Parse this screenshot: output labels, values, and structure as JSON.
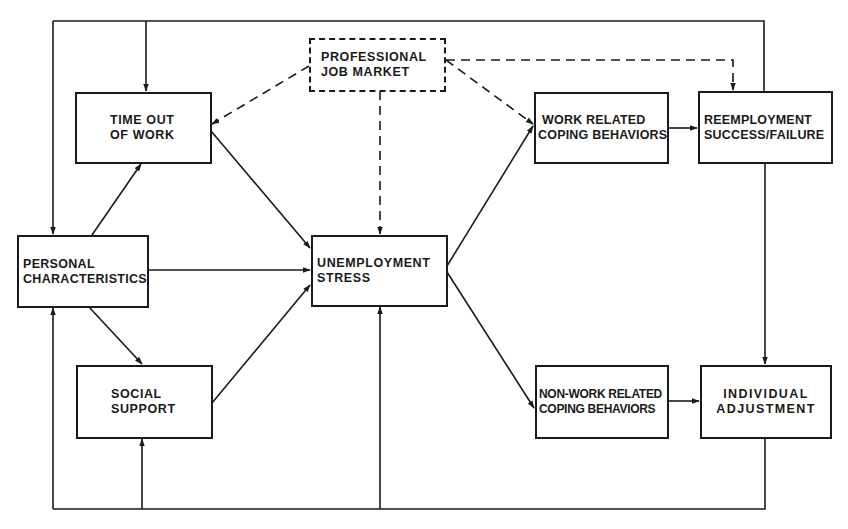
{
  "diagram": {
    "type": "flow",
    "nodes": {
      "professional_job_market": {
        "lines": [
          "PROFESSIONAL",
          "JOB MARKET"
        ],
        "style": "dashed"
      },
      "time_out_of_work": {
        "lines": [
          "TIME OUT",
          "OF WORK"
        ]
      },
      "personal_characteristics": {
        "lines": [
          "PERSONAL",
          "CHARACTERISTICS"
        ]
      },
      "social_support": {
        "lines": [
          "SOCIAL",
          "SUPPORT"
        ]
      },
      "unemployment_stress": {
        "lines": [
          "UNEMPLOYMENT",
          "STRESS"
        ]
      },
      "work_related_coping": {
        "lines": [
          "WORK RELATED",
          "COPING BEHAVIORS"
        ]
      },
      "nonwork_related_coping": {
        "lines": [
          "NON-WORK RELATED",
          "COPING BEHAVIORS"
        ]
      },
      "reemployment": {
        "lines": [
          "REEMPLOYMENT",
          "SUCCESS/FAILURE"
        ]
      },
      "individual_adjustment": {
        "lines": [
          "INDIVIDUAL",
          "ADJUSTMENT"
        ]
      }
    },
    "edges": [
      {
        "from": "professional_job_market",
        "to": "time_out_of_work",
        "style": "dashed"
      },
      {
        "from": "professional_job_market",
        "to": "unemployment_stress",
        "style": "dashed"
      },
      {
        "from": "professional_job_market",
        "to": "work_related_coping",
        "style": "dashed"
      },
      {
        "from": "professional_job_market",
        "to": "reemployment",
        "style": "dashed"
      },
      {
        "from": "personal_characteristics",
        "to": "time_out_of_work",
        "style": "solid"
      },
      {
        "from": "personal_characteristics",
        "to": "unemployment_stress",
        "style": "solid"
      },
      {
        "from": "personal_characteristics",
        "to": "social_support",
        "style": "solid"
      },
      {
        "from": "time_out_of_work",
        "to": "unemployment_stress",
        "style": "solid"
      },
      {
        "from": "social_support",
        "to": "unemployment_stress",
        "style": "solid"
      },
      {
        "from": "unemployment_stress",
        "to": "work_related_coping",
        "style": "solid"
      },
      {
        "from": "unemployment_stress",
        "to": "nonwork_related_coping",
        "style": "solid"
      },
      {
        "from": "work_related_coping",
        "to": "reemployment",
        "style": "solid"
      },
      {
        "from": "nonwork_related_coping",
        "to": "individual_adjustment",
        "style": "solid"
      },
      {
        "from": "reemployment",
        "to": "individual_adjustment",
        "style": "solid"
      },
      {
        "from": "reemployment",
        "to": "personal_characteristics",
        "style": "solid",
        "route": "top-feedback"
      },
      {
        "from": "reemployment",
        "to": "time_out_of_work",
        "style": "solid",
        "route": "top-feedback"
      },
      {
        "from": "individual_adjustment",
        "to": "personal_characteristics",
        "style": "solid",
        "route": "bottom-feedback"
      },
      {
        "from": "individual_adjustment",
        "to": "social_support",
        "style": "solid",
        "route": "bottom-feedback"
      },
      {
        "from": "individual_adjustment",
        "to": "unemployment_stress",
        "style": "solid",
        "route": "bottom-feedback"
      }
    ],
    "colors": {
      "ink": "#1a1a1a",
      "paper": "#ffffff"
    }
  }
}
